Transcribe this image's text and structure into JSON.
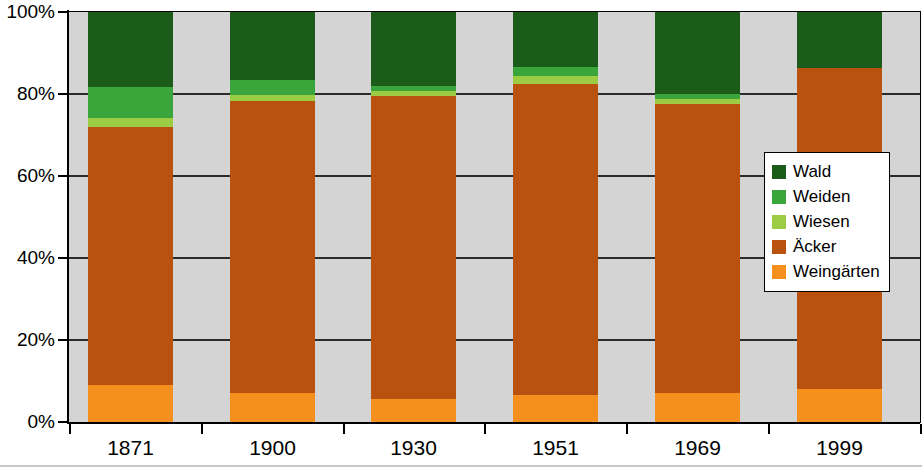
{
  "chart_data": {
    "type": "bar",
    "subtype": "stacked-100-percent",
    "title": "",
    "xlabel": "",
    "ylabel": "",
    "categories": [
      "1871",
      "1900",
      "1930",
      "1951",
      "1969",
      "1999"
    ],
    "ylim": [
      0,
      100
    ],
    "y_ticks": [
      "0%",
      "20%",
      "40%",
      "60%",
      "80%",
      "100%"
    ],
    "y_tick_values": [
      0,
      20,
      40,
      60,
      80,
      100
    ],
    "grid": true,
    "legend_position": "right-middle",
    "series": [
      {
        "name": "Weingärten",
        "color": "#f5901e",
        "values": [
          9.0,
          7.0,
          5.5,
          6.5,
          7.0,
          8.0
        ]
      },
      {
        "name": "Äcker",
        "color": "#b9510f",
        "values": [
          62.9,
          71.3,
          74.0,
          76.0,
          70.5,
          78.3
        ]
      },
      {
        "name": "Wiesen",
        "color": "#9bcc44",
        "values": [
          2.2,
          1.5,
          1.3,
          2.0,
          1.3,
          0.0
        ]
      },
      {
        "name": "Weiden",
        "color": "#3aa53a",
        "values": [
          7.6,
          3.7,
          1.2,
          2.0,
          1.2,
          0.0
        ]
      },
      {
        "name": "Wald",
        "color": "#1b5c1b",
        "values": [
          18.3,
          16.5,
          18.0,
          13.5,
          20.0,
          13.7
        ]
      }
    ]
  },
  "legend": {
    "items": [
      {
        "label": "Wald",
        "color": "#1b5c1b"
      },
      {
        "label": "Weiden",
        "color": "#3aa53a"
      },
      {
        "label": "Wiesen",
        "color": "#9bcc44"
      },
      {
        "label": "Äcker",
        "color": "#b9510f"
      },
      {
        "label": "Weingärten",
        "color": "#f5901e"
      }
    ]
  },
  "colors": {
    "plot_background": "#d4d4d4",
    "axis": "#000000",
    "gridline": "#2b2b2b",
    "page_background": "#ffffff"
  }
}
